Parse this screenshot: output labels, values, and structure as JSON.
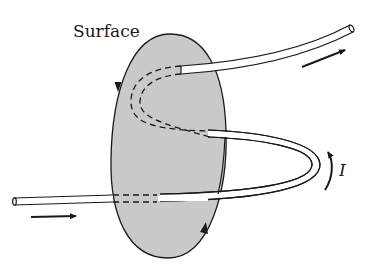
{
  "diagram": {
    "title_label": "Surface",
    "current_label": "I",
    "colors": {
      "surface_fill": "#c9c9c9",
      "outline": "#1a1a1a",
      "wire_fill": "#ffffff",
      "background": "#ffffff"
    },
    "elements": {
      "surface": "open surface bounded by closed loop (oriented boundary with arrows)",
      "wire": "current-carrying wire passing through the surface multiple times",
      "arrows": [
        "incoming current arrow (left)",
        "outgoing current arrow (upper right)",
        "current direction arrow I (right loop)",
        "boundary orientation arrows (2)"
      ]
    }
  }
}
